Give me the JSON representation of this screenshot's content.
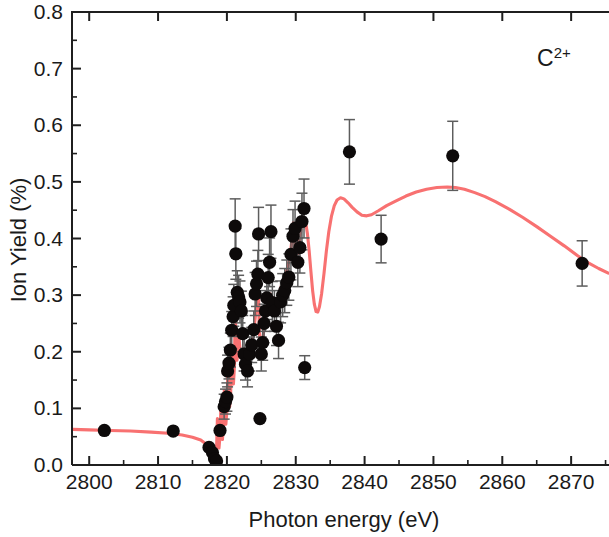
{
  "chart_data": {
    "type": "scatter",
    "title": "",
    "xlabel": "Photon energy (eV)",
    "ylabel": "Ion Yield (%)",
    "xlim": [
      2797.5,
      2875.5
    ],
    "ylim": [
      0.0,
      0.8
    ],
    "xticks": [
      2800,
      2810,
      2820,
      2830,
      2840,
      2850,
      2860,
      2870
    ],
    "xtick_labels": [
      "2800",
      "2810",
      "2820",
      "2830",
      "2840",
      "2850",
      "2860",
      "2870"
    ],
    "x_minor_step": 5,
    "yticks": [
      0.0,
      0.1,
      0.2,
      0.3,
      0.4,
      0.5,
      0.6,
      0.7,
      0.8
    ],
    "ytick_labels": [
      "0.0",
      "0.1",
      "0.2",
      "0.3",
      "0.4",
      "0.5",
      "0.6",
      "0.7",
      "0.8"
    ],
    "y_minor_step": 0.05,
    "grid": false,
    "legend": false,
    "annotations": [
      {
        "name": "ion-species",
        "text": "C",
        "superscript": "2+",
        "x": 2867.5,
        "y": 0.705
      }
    ],
    "marker_color": "#0d0a0a",
    "errorbar_color": "#5d5d5d",
    "curve_color": "#f87171",
    "axis_color": "#1f1f1f",
    "series": [
      {
        "name": "Measured ion yield",
        "marker": "filled-circle",
        "points": [
          {
            "x": 2802.2,
            "y": 0.061,
            "err": 0.0
          },
          {
            "x": 2812.2,
            "y": 0.06,
            "err": 0.0
          },
          {
            "x": 2817.4,
            "y": 0.031,
            "err": 0.0
          },
          {
            "x": 2817.9,
            "y": 0.022,
            "err": 0.0
          },
          {
            "x": 2818.2,
            "y": 0.011,
            "err": 0.0
          },
          {
            "x": 2818.5,
            "y": 0.007,
            "err": 0.0
          },
          {
            "x": 2819.0,
            "y": 0.061,
            "err": 0.0
          },
          {
            "x": 2819.6,
            "y": 0.103,
            "err": 0.022
          },
          {
            "x": 2819.8,
            "y": 0.112,
            "err": 0.022
          },
          {
            "x": 2820.0,
            "y": 0.12,
            "err": 0.025
          },
          {
            "x": 2820.1,
            "y": 0.166,
            "err": 0.028
          },
          {
            "x": 2820.3,
            "y": 0.18,
            "err": 0.028
          },
          {
            "x": 2820.5,
            "y": 0.203,
            "err": 0.03
          },
          {
            "x": 2820.7,
            "y": 0.238,
            "err": 0.033
          },
          {
            "x": 2820.9,
            "y": 0.262,
            "err": 0.035
          },
          {
            "x": 2821.0,
            "y": 0.282,
            "err": 0.037
          },
          {
            "x": 2821.2,
            "y": 0.422,
            "err": 0.048
          },
          {
            "x": 2821.3,
            "y": 0.373,
            "err": 0.045
          },
          {
            "x": 2821.5,
            "y": 0.305,
            "err": 0.038
          },
          {
            "x": 2821.7,
            "y": 0.297,
            "err": 0.038
          },
          {
            "x": 2821.9,
            "y": 0.288,
            "err": 0.037
          },
          {
            "x": 2822.1,
            "y": 0.272,
            "err": 0.035
          },
          {
            "x": 2822.3,
            "y": 0.232,
            "err": 0.032
          },
          {
            "x": 2822.5,
            "y": 0.196,
            "err": 0.03
          },
          {
            "x": 2822.7,
            "y": 0.178,
            "err": 0.028
          },
          {
            "x": 2823.0,
            "y": 0.166,
            "err": 0.028
          },
          {
            "x": 2823.3,
            "y": 0.196,
            "err": 0.03
          },
          {
            "x": 2823.6,
            "y": 0.212,
            "err": 0.031
          },
          {
            "x": 2823.9,
            "y": 0.239,
            "err": 0.033
          },
          {
            "x": 2824.1,
            "y": 0.302,
            "err": 0.038
          },
          {
            "x": 2824.3,
            "y": 0.32,
            "err": 0.04
          },
          {
            "x": 2824.5,
            "y": 0.337,
            "err": 0.042
          },
          {
            "x": 2824.6,
            "y": 0.408,
            "err": 0.047
          },
          {
            "x": 2824.8,
            "y": 0.082,
            "err": 0.0
          },
          {
            "x": 2825.0,
            "y": 0.196,
            "err": 0.03
          },
          {
            "x": 2825.2,
            "y": 0.216,
            "err": 0.031
          },
          {
            "x": 2825.4,
            "y": 0.25,
            "err": 0.034
          },
          {
            "x": 2825.6,
            "y": 0.272,
            "err": 0.036
          },
          {
            "x": 2825.8,
            "y": 0.295,
            "err": 0.038
          },
          {
            "x": 2826.0,
            "y": 0.331,
            "err": 0.041
          },
          {
            "x": 2826.2,
            "y": 0.358,
            "err": 0.043
          },
          {
            "x": 2826.4,
            "y": 0.412,
            "err": 0.047
          },
          {
            "x": 2826.6,
            "y": 0.287,
            "err": 0.037
          },
          {
            "x": 2826.9,
            "y": 0.272,
            "err": 0.036
          },
          {
            "x": 2827.2,
            "y": 0.245,
            "err": 0.034
          },
          {
            "x": 2827.5,
            "y": 0.22,
            "err": 0.032
          },
          {
            "x": 2827.8,
            "y": 0.288,
            "err": 0.037
          },
          {
            "x": 2828.1,
            "y": 0.3,
            "err": 0.038
          },
          {
            "x": 2828.4,
            "y": 0.308,
            "err": 0.039
          },
          {
            "x": 2828.7,
            "y": 0.322,
            "err": 0.04
          },
          {
            "x": 2829.0,
            "y": 0.332,
            "err": 0.041
          },
          {
            "x": 2829.3,
            "y": 0.372,
            "err": 0.045
          },
          {
            "x": 2829.6,
            "y": 0.404,
            "err": 0.047
          },
          {
            "x": 2829.9,
            "y": 0.418,
            "err": 0.048
          },
          {
            "x": 2830.3,
            "y": 0.358,
            "err": 0.043
          },
          {
            "x": 2830.6,
            "y": 0.384,
            "err": 0.045
          },
          {
            "x": 2830.9,
            "y": 0.43,
            "err": 0.05
          },
          {
            "x": 2831.2,
            "y": 0.453,
            "err": 0.052
          },
          {
            "x": 2831.3,
            "y": 0.172,
            "err": 0.021
          },
          {
            "x": 2837.8,
            "y": 0.553,
            "err": 0.057
          },
          {
            "x": 2842.4,
            "y": 0.399,
            "err": 0.042
          },
          {
            "x": 2852.8,
            "y": 0.546,
            "err": 0.061
          },
          {
            "x": 2871.6,
            "y": 0.356,
            "err": 0.04
          }
        ]
      }
    ],
    "fit_curve": {
      "name": "Theoretical fit",
      "color": "#f87171",
      "description": "Smooth baseline with sharp Rydberg resonance spikes between 2818 and 2832, deep minimum near 2833, broad shoulder near 2838, local maximum near 2853, falling tail to 2875",
      "points": [
        [
          2797.6,
          0.063
        ],
        [
          2800.0,
          0.062
        ],
        [
          2803.0,
          0.061
        ],
        [
          2806.0,
          0.06
        ],
        [
          2809.0,
          0.058
        ],
        [
          2811.5,
          0.056
        ],
        [
          2813.5,
          0.053
        ],
        [
          2815.0,
          0.049
        ],
        [
          2816.2,
          0.044
        ],
        [
          2817.2,
          0.035
        ],
        [
          2817.9,
          0.023
        ],
        [
          2818.35,
          0.01
        ],
        [
          2818.5,
          0.03
        ],
        [
          2818.62,
          0.082
        ],
        [
          2818.72,
          0.04
        ],
        [
          2818.85,
          0.03
        ],
        [
          2819.0,
          0.052
        ],
        [
          2819.12,
          0.1
        ],
        [
          2819.22,
          0.055
        ],
        [
          2819.35,
          0.045
        ],
        [
          2819.5,
          0.07
        ],
        [
          2819.62,
          0.132
        ],
        [
          2819.72,
          0.082
        ],
        [
          2819.85,
          0.072
        ],
        [
          2820.0,
          0.095
        ],
        [
          2820.12,
          0.16
        ],
        [
          2820.25,
          0.11
        ],
        [
          2820.4,
          0.103
        ],
        [
          2820.55,
          0.128
        ],
        [
          2820.68,
          0.2
        ],
        [
          2820.8,
          0.15
        ],
        [
          2820.95,
          0.143
        ],
        [
          2821.1,
          0.175
        ],
        [
          2821.22,
          0.305
        ],
        [
          2821.32,
          0.2
        ],
        [
          2821.45,
          0.185
        ],
        [
          2821.6,
          0.196
        ],
        [
          2821.75,
          0.225
        ],
        [
          2821.9,
          0.205
        ],
        [
          2822.1,
          0.196
        ],
        [
          2822.3,
          0.198
        ],
        [
          2822.5,
          0.205
        ],
        [
          2822.7,
          0.188
        ],
        [
          2822.9,
          0.172
        ],
        [
          2823.1,
          0.178
        ],
        [
          2823.35,
          0.195
        ],
        [
          2823.6,
          0.21
        ],
        [
          2823.85,
          0.232
        ],
        [
          2824.1,
          0.258
        ],
        [
          2824.3,
          0.282
        ],
        [
          2824.45,
          0.3
        ],
        [
          2824.55,
          0.318
        ],
        [
          2824.62,
          0.285
        ],
        [
          2824.7,
          0.24
        ],
        [
          2824.8,
          0.215
        ],
        [
          2824.95,
          0.205
        ],
        [
          2825.1,
          0.215
        ],
        [
          2825.3,
          0.232
        ],
        [
          2825.5,
          0.25
        ],
        [
          2825.7,
          0.268
        ],
        [
          2825.9,
          0.282
        ],
        [
          2826.1,
          0.295
        ],
        [
          2826.3,
          0.302
        ],
        [
          2826.5,
          0.298
        ],
        [
          2826.7,
          0.292
        ],
        [
          2826.9,
          0.288
        ],
        [
          2827.1,
          0.285
        ],
        [
          2827.3,
          0.288
        ],
        [
          2827.55,
          0.3
        ],
        [
          2827.8,
          0.312
        ],
        [
          2828.05,
          0.322
        ],
        [
          2828.3,
          0.33
        ],
        [
          2828.55,
          0.338
        ],
        [
          2828.8,
          0.348
        ],
        [
          2829.05,
          0.362
        ],
        [
          2829.3,
          0.382
        ],
        [
          2829.5,
          0.405
        ],
        [
          2829.65,
          0.428
        ],
        [
          2829.78,
          0.412
        ],
        [
          2829.9,
          0.382
        ],
        [
          2830.05,
          0.355
        ],
        [
          2830.2,
          0.36
        ],
        [
          2830.4,
          0.38
        ],
        [
          2830.6,
          0.402
        ],
        [
          2830.8,
          0.42
        ],
        [
          2831.0,
          0.432
        ],
        [
          2831.2,
          0.436
        ],
        [
          2831.45,
          0.428
        ],
        [
          2831.7,
          0.408
        ],
        [
          2831.95,
          0.378
        ],
        [
          2832.2,
          0.342
        ],
        [
          2832.45,
          0.308
        ],
        [
          2832.7,
          0.284
        ],
        [
          2832.95,
          0.271
        ],
        [
          2833.2,
          0.27
        ],
        [
          2833.45,
          0.28
        ],
        [
          2833.75,
          0.302
        ],
        [
          2834.1,
          0.338
        ],
        [
          2834.45,
          0.378
        ],
        [
          2834.8,
          0.412
        ],
        [
          2835.2,
          0.44
        ],
        [
          2835.6,
          0.458
        ],
        [
          2836.0,
          0.468
        ],
        [
          2836.5,
          0.472
        ],
        [
          2837.0,
          0.47
        ],
        [
          2837.6,
          0.463
        ],
        [
          2838.2,
          0.455
        ],
        [
          2838.9,
          0.447
        ],
        [
          2839.6,
          0.441
        ],
        [
          2840.3,
          0.44
        ],
        [
          2841.0,
          0.442
        ],
        [
          2842.0,
          0.449
        ],
        [
          2843.2,
          0.458
        ],
        [
          2844.5,
          0.466
        ],
        [
          2846.0,
          0.475
        ],
        [
          2847.5,
          0.482
        ],
        [
          2849.0,
          0.487
        ],
        [
          2850.5,
          0.49
        ],
        [
          2852.0,
          0.491
        ],
        [
          2853.2,
          0.49
        ],
        [
          2854.5,
          0.487
        ],
        [
          2856.0,
          0.481
        ],
        [
          2857.5,
          0.474
        ],
        [
          2859.0,
          0.465
        ],
        [
          2861.0,
          0.452
        ],
        [
          2863.0,
          0.437
        ],
        [
          2865.0,
          0.421
        ],
        [
          2867.0,
          0.404
        ],
        [
          2869.0,
          0.387
        ],
        [
          2871.0,
          0.369
        ],
        [
          2872.5,
          0.357
        ],
        [
          2874.0,
          0.347
        ],
        [
          2875.4,
          0.339
        ]
      ]
    }
  },
  "axes": {
    "x_title": "Photon energy (eV)",
    "y_title": "Ion Yield (%)"
  }
}
